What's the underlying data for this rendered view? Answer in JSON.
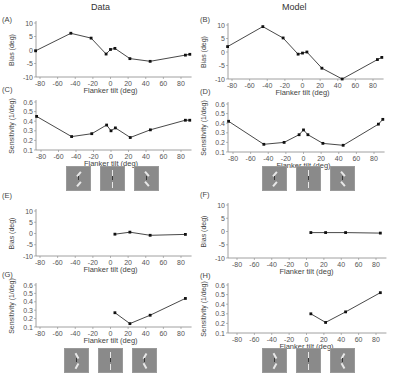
{
  "columns": {
    "left_title": "Data",
    "right_title": "Model"
  },
  "stimuli": {
    "top_row": [
      {
        "flanker_tilt": 45,
        "label": "flanker +45"
      },
      {
        "flanker_tilt": 0,
        "label": "flanker 0"
      },
      {
        "flanker_tilt": -45,
        "label": "flanker -45"
      }
    ],
    "bottom_row": [
      {
        "flanker_tilt": -30,
        "label": "flanker pair tilted"
      },
      {
        "flanker_tilt": 0,
        "label": "flanker pair vertical"
      },
      {
        "flanker_tilt": 30,
        "label": "flanker pair tilted"
      }
    ]
  },
  "chart_data": [
    {
      "panel": "A",
      "column": "Data",
      "type": "line",
      "title": "",
      "xlabel": "Flanker tilt (deg)",
      "ylabel": "Bias (deg)",
      "xlim": [
        -90,
        90
      ],
      "ylim": [
        -10,
        10
      ],
      "xticks": [
        -80,
        -60,
        -40,
        -20,
        0,
        20,
        40,
        60,
        80
      ],
      "yticks": [
        -10,
        -5,
        0,
        5,
        10
      ],
      "x": [
        -85,
        -45,
        -22,
        -5,
        0,
        5,
        22,
        45,
        85,
        90
      ],
      "y": [
        -0.3,
        6.2,
        4.4,
        -1.5,
        0.2,
        0.6,
        -3.2,
        -4.2,
        -1.9,
        -1.6
      ]
    },
    {
      "panel": "B",
      "column": "Model",
      "type": "line",
      "title": "",
      "xlabel": "Flanker tilt (deg)",
      "ylabel": "Bias (deg)",
      "xlim": [
        -90,
        90
      ],
      "ylim": [
        -10,
        10
      ],
      "xticks": [
        -80,
        -60,
        -40,
        -20,
        0,
        20,
        40,
        60,
        80
      ],
      "yticks": [
        -10,
        -5,
        0,
        5,
        10
      ],
      "x": [
        -85,
        -45,
        -22,
        -5,
        0,
        5,
        22,
        45,
        85,
        90
      ],
      "y": [
        2.0,
        9.4,
        5.2,
        -0.8,
        -0.4,
        0.0,
        -6.0,
        -10.0,
        -2.8,
        -2.0
      ]
    },
    {
      "panel": "C",
      "column": "Data",
      "type": "line",
      "title": "",
      "xlabel": "Flanker tilt (deg)",
      "ylabel": "Sensitivity (1/deg)",
      "xlim": [
        -90,
        90
      ],
      "ylim": [
        0.1,
        0.65
      ],
      "xticks": [
        -80,
        -60,
        -40,
        -20,
        0,
        20,
        40,
        60,
        80
      ],
      "yticks": [
        0.1,
        0.2,
        0.3,
        0.4,
        0.5,
        0.6
      ],
      "x": [
        -85,
        -45,
        -22,
        -5,
        0,
        5,
        22,
        45,
        85,
        90
      ],
      "y": [
        0.45,
        0.24,
        0.27,
        0.36,
        0.3,
        0.33,
        0.23,
        0.31,
        0.41,
        0.41
      ]
    },
    {
      "panel": "D",
      "column": "Model",
      "type": "line",
      "title": "",
      "xlabel": "Flanker tilt (deg)",
      "ylabel": "Sensitivity (1/deg)",
      "xlim": [
        -90,
        90
      ],
      "ylim": [
        0.1,
        0.65
      ],
      "xticks": [
        -80,
        -60,
        -40,
        -20,
        0,
        20,
        40,
        60,
        80
      ],
      "yticks": [
        0.1,
        0.2,
        0.3,
        0.4,
        0.5,
        0.6
      ],
      "x": [
        -85,
        -45,
        -22,
        -5,
        0,
        5,
        22,
        45,
        85,
        90
      ],
      "y": [
        0.42,
        0.18,
        0.2,
        0.28,
        0.33,
        0.28,
        0.19,
        0.17,
        0.39,
        0.44
      ]
    },
    {
      "panel": "E",
      "column": "Data",
      "type": "line",
      "title": "",
      "xlabel": "Flanker tilt (deg)",
      "ylabel": "Bias (deg)",
      "xlim": [
        -90,
        90
      ],
      "ylim": [
        -10,
        10
      ],
      "xticks": [
        -80,
        -60,
        -40,
        -20,
        0,
        20,
        40,
        60,
        80
      ],
      "yticks": [
        -10,
        -5,
        0,
        5,
        10
      ],
      "x": [
        5,
        22,
        45,
        85
      ],
      "y": [
        -0.3,
        0.6,
        -0.8,
        -0.4
      ]
    },
    {
      "panel": "F",
      "column": "Model",
      "type": "line",
      "title": "",
      "xlabel": "Flanker tilt (deg)",
      "ylabel": "Bias (deg)",
      "xlim": [
        -90,
        90
      ],
      "ylim": [
        -10,
        10
      ],
      "xticks": [
        -80,
        -60,
        -40,
        -20,
        0,
        20,
        40,
        60,
        80
      ],
      "yticks": [
        -10,
        -5,
        0,
        5,
        10
      ],
      "x": [
        5,
        22,
        45,
        85
      ],
      "y": [
        -0.4,
        -0.4,
        -0.4,
        -0.6
      ]
    },
    {
      "panel": "G",
      "column": "Data",
      "type": "line",
      "title": "",
      "xlabel": "Flanker tilt (deg)",
      "ylabel": "Sensitivity (1/deg)",
      "xlim": [
        -90,
        90
      ],
      "ylim": [
        0.1,
        0.65
      ],
      "xticks": [
        -80,
        -60,
        -40,
        -20,
        0,
        20,
        40,
        60,
        80
      ],
      "yticks": [
        0.1,
        0.2,
        0.3,
        0.4,
        0.5,
        0.6
      ],
      "x": [
        5,
        22,
        45,
        85
      ],
      "y": [
        0.27,
        0.14,
        0.24,
        0.44
      ]
    },
    {
      "panel": "H",
      "column": "Model",
      "type": "line",
      "title": "",
      "xlabel": "Flanker tilt (deg)",
      "ylabel": "Sensitivity (1/deg)",
      "xlim": [
        -90,
        90
      ],
      "ylim": [
        0.1,
        0.65
      ],
      "xticks": [
        -80,
        -60,
        -40,
        -20,
        0,
        20,
        40,
        60,
        80
      ],
      "yticks": [
        0.1,
        0.2,
        0.3,
        0.4,
        0.5,
        0.6
      ],
      "x": [
        5,
        22,
        45,
        85
      ],
      "y": [
        0.3,
        0.21,
        0.32,
        0.52
      ]
    }
  ]
}
